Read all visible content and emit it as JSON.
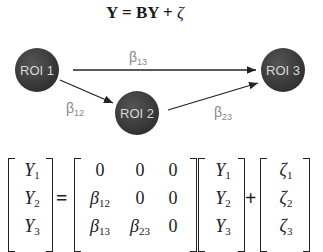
{
  "title": {
    "lhs": "Y = BY + ",
    "zeta": "ζ"
  },
  "nodes": [
    {
      "id": "roi1",
      "label": "ROI 1",
      "cx": 37,
      "cy": 70
    },
    {
      "id": "roi2",
      "label": "ROI 2",
      "cx": 137,
      "cy": 111
    },
    {
      "id": "roi3",
      "label": "ROI 3",
      "cx": 283,
      "cy": 70
    }
  ],
  "edges": [
    {
      "from": "roi1",
      "to": "roi3",
      "symbol": "β",
      "sub": "13"
    },
    {
      "from": "roi1",
      "to": "roi2",
      "symbol": "β",
      "sub": "12"
    },
    {
      "from": "roi2",
      "to": "roi3",
      "symbol": "β",
      "sub": "23"
    }
  ],
  "colors": {
    "node_fill": "#3a3a3a",
    "node_text": "#d8d8d8",
    "edge": "#222222",
    "edge_label": "#888888"
  },
  "equation": {
    "lhs_vector": [
      {
        "sym": "Y",
        "sub": "1"
      },
      {
        "sym": "Y",
        "sub": "2"
      },
      {
        "sym": "Y",
        "sub": "3"
      }
    ],
    "equals": "=",
    "matrix": [
      [
        {
          "sym": "0",
          "sub": ""
        },
        {
          "sym": "0",
          "sub": ""
        },
        {
          "sym": "0",
          "sub": ""
        }
      ],
      [
        {
          "sym": "β",
          "sub": "12"
        },
        {
          "sym": "0",
          "sub": ""
        },
        {
          "sym": "0",
          "sub": ""
        }
      ],
      [
        {
          "sym": "β",
          "sub": "13"
        },
        {
          "sym": "β",
          "sub": "23"
        },
        {
          "sym": "0",
          "sub": ""
        }
      ]
    ],
    "rhs_vector": [
      {
        "sym": "Y",
        "sub": "1"
      },
      {
        "sym": "Y",
        "sub": "2"
      },
      {
        "sym": "Y",
        "sub": "3"
      }
    ],
    "plus": "+",
    "error_vector": [
      {
        "sym": "ζ",
        "sub": "1"
      },
      {
        "sym": "ζ",
        "sub": "2"
      },
      {
        "sym": "ζ",
        "sub": "3"
      }
    ]
  }
}
